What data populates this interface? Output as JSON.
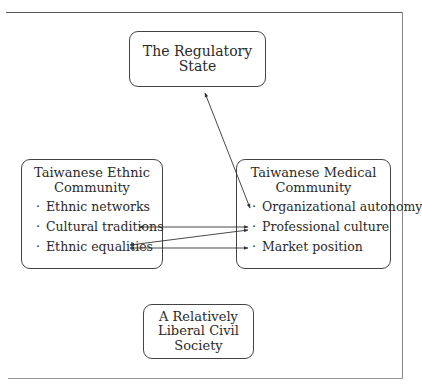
{
  "diagram": {
    "nodes": {
      "regulatory_state": {
        "title": "The Regulatory State"
      },
      "ethnic_community": {
        "title_line1": "Taiwanese Ethnic",
        "title_line2": "Community",
        "bullet": "·",
        "items": [
          "Ethnic networks",
          "Cultural traditions",
          "Ethnic equalities"
        ]
      },
      "medical_community": {
        "title_line1": "Taiwanese Medical",
        "title_line2": "Community",
        "bullet": "·",
        "items": [
          "Organizational autonomy",
          "Professional culture",
          "Market position"
        ]
      },
      "civil_society": {
        "title_line1": "A Relatively",
        "title_line2": "Liberal Civil",
        "title_line3": "Society"
      }
    },
    "edges": [
      {
        "from": "The Regulatory State",
        "to": "Organizational autonomy",
        "direction": "both"
      },
      {
        "from": "Cultural traditions",
        "to": "Professional culture",
        "direction": "both"
      },
      {
        "from": "Ethnic equalities",
        "to": "Professional culture",
        "direction": "both"
      },
      {
        "from": "Ethnic equalities",
        "to": "Market position",
        "direction": "both"
      }
    ],
    "colors": {
      "line": "#333333",
      "box_border": "#444444",
      "text": "#2a2a2a"
    }
  }
}
